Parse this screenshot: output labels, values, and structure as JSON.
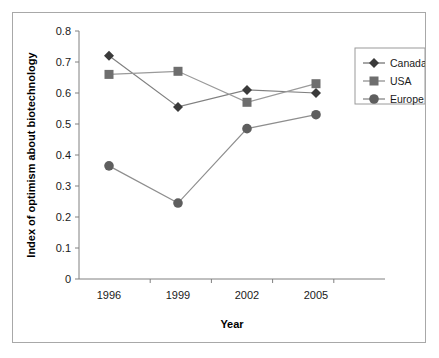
{
  "chart_data": {
    "type": "line",
    "title": "",
    "xlabel": "Year",
    "ylabel": "Index of optimism about biotechnology",
    "categories": [
      "1996",
      "1999",
      "2002",
      "2005"
    ],
    "x": [
      1996,
      1999,
      2002,
      2005
    ],
    "xlim": [
      1996,
      2005
    ],
    "ylim": [
      0,
      0.8
    ],
    "yticks": [
      "0",
      "0.1",
      "0.2",
      "0.3",
      "0.4",
      "0.5",
      "0.6",
      "0.7",
      "0.8"
    ],
    "ytick_values": [
      0,
      0.1,
      0.2,
      0.3,
      0.4,
      0.5,
      0.6,
      0.7,
      0.8
    ],
    "xticks": [
      "1996",
      "1999",
      "2002",
      "2005"
    ],
    "grid": false,
    "legend_position": "top-right",
    "series": [
      {
        "name": "Canada",
        "marker": "diamond",
        "color": "#3a3a3a",
        "line_color": "#808080",
        "values": [
          0.72,
          0.555,
          0.61,
          0.6
        ]
      },
      {
        "name": "USA",
        "marker": "square",
        "color": "#6e6e6e",
        "line_color": "#9a9a9a",
        "values": [
          0.66,
          0.67,
          0.57,
          0.63
        ]
      },
      {
        "name": "Europe",
        "marker": "circle",
        "color": "#5e5e5e",
        "line_color": "#8e8e8e",
        "values": [
          0.365,
          0.245,
          0.485,
          0.53
        ]
      }
    ]
  },
  "legend": {
    "items": [
      {
        "label": "Canada",
        "marker": "diamond"
      },
      {
        "label": "USA",
        "marker": "square"
      },
      {
        "label": "Europe",
        "marker": "circle"
      }
    ]
  },
  "axes": {
    "x_title": "Year",
    "y_title": "Index of optimism about biotechnology"
  },
  "colors": {
    "frame": "#a8a8a8",
    "axis": "#808080",
    "text": "#1a1a1a",
    "canada": "#3a3a3a",
    "usa": "#6e6e6e",
    "europe": "#5e5e5e",
    "background": "#ffffff"
  }
}
